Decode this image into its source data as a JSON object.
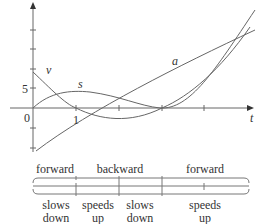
{
  "figure": {
    "axis": {
      "x_label": "t",
      "y_tick_labels": [
        "5",
        "0"
      ],
      "x_tick_labels": [
        "1"
      ]
    },
    "curve_labels": {
      "v": "v",
      "s": "s",
      "a": "a"
    },
    "direction": [
      {
        "label": "forward"
      },
      {
        "label": "backward"
      },
      {
        "label": "forward"
      }
    ],
    "speed": [
      {
        "line1": "slows",
        "line2": "down"
      },
      {
        "line1": "speeds",
        "line2": "up"
      },
      {
        "line1": "slows",
        "line2": "down"
      },
      {
        "line1": "speeds",
        "line2": "up"
      }
    ],
    "colors": {
      "stroke": "#555555",
      "text": "#333333"
    }
  }
}
